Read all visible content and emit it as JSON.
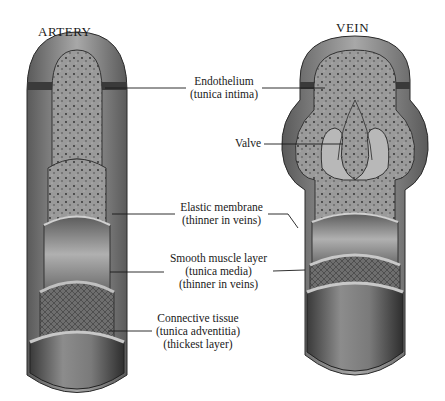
{
  "titles": {
    "artery": "ARTERY",
    "vein": "VEIN"
  },
  "labels": {
    "endothelium": [
      "Endothelium",
      "(tunica intima)"
    ],
    "valve": [
      "Valve"
    ],
    "elastic": [
      "Elastic membrane",
      "(thinner in veins)"
    ],
    "muscle": [
      "Smooth muscle layer",
      "(tunica media)",
      "(thinner in veins)"
    ],
    "connective": [
      "Connective tissue",
      "(tunica adventitia)",
      "(thickest layer)"
    ]
  }
}
